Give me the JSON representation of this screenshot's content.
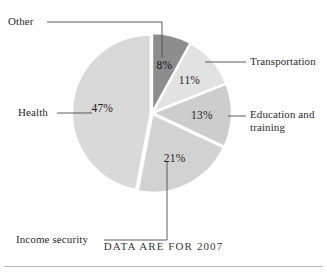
{
  "caption": "DATA ARE FOR 2007",
  "chart_data": {
    "type": "pie",
    "title": "",
    "subtitle": "",
    "xlabel": "",
    "ylabel": "",
    "legend_position": "callout-labels",
    "grid": false,
    "units": "percent",
    "start_angle_deg": 0,
    "direction": "clockwise",
    "categories": [
      "Other",
      "Transportation",
      "Education and training",
      "Income security",
      "Health"
    ],
    "values": [
      8,
      11,
      13,
      21,
      47
    ],
    "slices": [
      {
        "label": "Other",
        "value": 8,
        "value_label": "8%",
        "color": "#8d8d8d",
        "label_position": "top-left"
      },
      {
        "label": "Transportation",
        "value": 11,
        "value_label": "11%",
        "color": "#e2e2e2",
        "label_position": "right"
      },
      {
        "label": "Education and\ntraining",
        "value": 13,
        "value_label": "13%",
        "color": "#cdcdcd",
        "label_position": "right"
      },
      {
        "label": "Income security",
        "value": 21,
        "value_label": "21%",
        "color": "#d2d2d2",
        "label_position": "bottom-left"
      },
      {
        "label": "Health",
        "value": 47,
        "value_label": "47%",
        "color": "#d9d9d9",
        "label_position": "left"
      }
    ],
    "annotations": [
      "DATA ARE FOR 2007"
    ]
  }
}
